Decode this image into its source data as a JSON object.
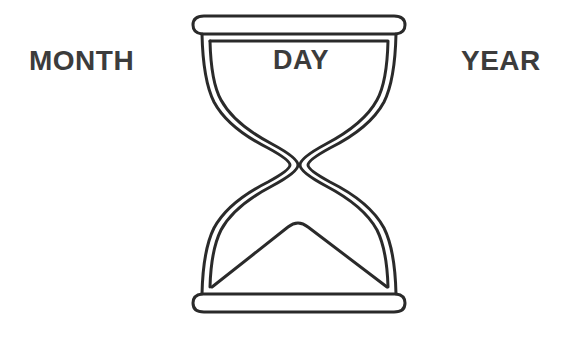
{
  "labels": {
    "month": "MONTH",
    "day": "DAY",
    "year": "YEAR"
  },
  "icons": {
    "center": "hourglass-icon"
  },
  "colors": {
    "text": "#3c3c3c",
    "outline": "#2a2a2a",
    "background": "#ffffff"
  }
}
